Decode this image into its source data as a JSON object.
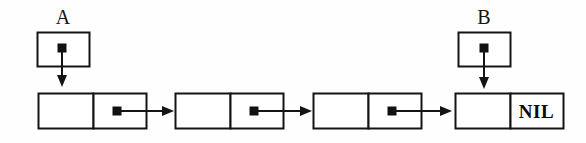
{
  "diagram": {
    "type": "linked-list",
    "background_color": "#fefefe",
    "stroke_color": "#141414",
    "fill_color": "#ffffff",
    "dot_color": "#111111",
    "canvas": {
      "width": 586,
      "height": 143
    },
    "pointer_variables": [
      {
        "id": "A",
        "label": "A",
        "box": {
          "x": 37,
          "y": 32,
          "w": 52,
          "h": 34
        },
        "label_pos": {
          "x": 37,
          "y": 7,
          "w": 52
        },
        "dot": {
          "cx": 62,
          "cy": 48,
          "size": 9
        },
        "arrow": {
          "x": 62,
          "y1": 48,
          "y2": 86
        },
        "target_node": 1
      },
      {
        "id": "B",
        "label": "B",
        "box": {
          "x": 458,
          "y": 32,
          "w": 52,
          "h": 34
        },
        "label_pos": {
          "x": 458,
          "y": 7,
          "w": 52
        },
        "dot": {
          "cx": 484,
          "cy": 48,
          "size": 9
        },
        "arrow": {
          "x": 484,
          "y1": 48,
          "y2": 88
        },
        "target_node": 4
      }
    ],
    "nodes": [
      {
        "index": 1,
        "data_cell": {
          "x": 38,
          "y": 93,
          "w": 55,
          "h": 35,
          "value": ""
        },
        "next_cell": {
          "x": 93,
          "y": 93,
          "w": 53,
          "h": 35,
          "value": ""
        },
        "dot": {
          "cx": 117,
          "cy": 111,
          "size": 9
        },
        "next_arrow": {
          "x1": 117,
          "x2": 173,
          "y": 111
        },
        "has_next": true
      },
      {
        "index": 2,
        "data_cell": {
          "x": 175,
          "y": 93,
          "w": 55,
          "h": 35,
          "value": ""
        },
        "next_cell": {
          "x": 230,
          "y": 93,
          "w": 53,
          "h": 35,
          "value": ""
        },
        "dot": {
          "cx": 254,
          "cy": 111,
          "size": 9
        },
        "next_arrow": {
          "x1": 254,
          "x2": 311,
          "y": 111
        },
        "has_next": true
      },
      {
        "index": 3,
        "data_cell": {
          "x": 313,
          "y": 93,
          "w": 55,
          "h": 35,
          "value": ""
        },
        "next_cell": {
          "x": 368,
          "y": 93,
          "w": 53,
          "h": 35,
          "value": ""
        },
        "dot": {
          "cx": 392,
          "cy": 111,
          "size": 9
        },
        "next_arrow": {
          "x1": 392,
          "x2": 451,
          "y": 111
        },
        "has_next": true
      },
      {
        "index": 4,
        "data_cell": {
          "x": 455,
          "y": 93,
          "w": 55,
          "h": 35,
          "value": ""
        },
        "next_cell": {
          "x": 510,
          "y": 93,
          "w": 53,
          "h": 35,
          "value": "NIL"
        },
        "dot": null,
        "next_arrow": null,
        "has_next": false
      }
    ],
    "terminator": {
      "label": "NIL",
      "pos": {
        "x": 510,
        "y": 103,
        "w": 53
      }
    }
  }
}
